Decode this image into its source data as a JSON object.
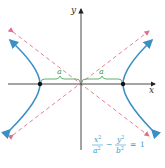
{
  "figure": {
    "type": "hyperbola",
    "axes": {
      "x_label": "x",
      "y_label": "y"
    },
    "brace_labels": {
      "left": "a",
      "right": "a"
    },
    "equation": {
      "lhs_term1_num": "x",
      "lhs_term1_num_exp": "2",
      "lhs_term1_den": "a",
      "lhs_term1_den_exp": "2",
      "operator": "−",
      "lhs_term2_num": "y",
      "lhs_term2_num_exp": "2",
      "lhs_term2_den": "b",
      "lhs_term2_den_exp": "2",
      "equals": "=",
      "rhs": "1"
    },
    "colors": {
      "curve": "#3a8fc4",
      "asymptote": "#e0708a",
      "axis": "#333333",
      "brace": "#3aa04a",
      "equation": "#3a9bc4",
      "vertex": "#111111"
    }
  }
}
